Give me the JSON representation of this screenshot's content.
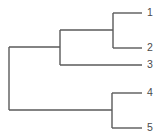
{
  "figure": {
    "width": 165,
    "height": 140,
    "background_color": "#ffffff",
    "line_color": "#5a5a5a",
    "label_color": "#4a4a4a"
  },
  "chart_data": {
    "type": "diagram",
    "diagram_type": "dendrogram",
    "orientation": "horizontal-right-facing",
    "title": "",
    "xlabel": "",
    "ylabel": "",
    "grid": false,
    "legend": null,
    "axis_visible": false,
    "leaves": [
      {
        "id": "leaf-1",
        "label": "1",
        "y": 13,
        "branch_x_start": 113,
        "branch_x_end": 142,
        "label_x": 147
      },
      {
        "id": "leaf-2",
        "label": "2",
        "y": 48,
        "branch_x_start": 113,
        "branch_x_end": 142,
        "label_x": 147
      },
      {
        "id": "leaf-3",
        "label": "3",
        "y": 65,
        "branch_x_start": 60,
        "branch_x_end": 142,
        "label_x": 147
      },
      {
        "id": "leaf-4",
        "label": "4",
        "y": 93,
        "branch_x_start": 112,
        "branch_x_end": 142,
        "label_x": 147
      },
      {
        "id": "leaf-5",
        "label": "5",
        "y": 128,
        "branch_x_start": 112,
        "branch_x_end": 142,
        "label_x": 147
      }
    ],
    "nodes": [
      {
        "id": "node-root",
        "name": "root-node",
        "x": 9,
        "y_top": 47,
        "y_bottom": 110,
        "children": [
          "node-a",
          "node-c"
        ],
        "child_branches": [
          {
            "to": "node-a",
            "y": 47,
            "x_from": 9,
            "x_to": 60
          },
          {
            "to": "node-c",
            "y": 110,
            "x_from": 9,
            "x_to": 112
          }
        ]
      },
      {
        "id": "node-a",
        "name": "cluster-123-node",
        "x": 60,
        "y_top": 30,
        "y_bottom": 65,
        "children": [
          "node-b",
          "leaf-3"
        ],
        "child_branches": [
          {
            "to": "node-b",
            "y": 30,
            "x_from": 60,
            "x_to": 113
          },
          {
            "to": "leaf-3",
            "y": 65,
            "x_from": 60,
            "x_to": 142
          }
        ]
      },
      {
        "id": "node-b",
        "name": "cluster-12-node",
        "x": 113,
        "y_top": 13,
        "y_bottom": 48,
        "children": [
          "leaf-1",
          "leaf-2"
        ],
        "child_branches": [
          {
            "to": "leaf-1",
            "y": 13,
            "x_from": 113,
            "x_to": 142
          },
          {
            "to": "leaf-2",
            "y": 48,
            "x_from": 113,
            "x_to": 142
          }
        ]
      },
      {
        "id": "node-c",
        "name": "cluster-45-node",
        "x": 112,
        "y_top": 93,
        "y_bottom": 128,
        "children": [
          "leaf-4",
          "leaf-5"
        ],
        "child_branches": [
          {
            "to": "leaf-4",
            "y": 93,
            "x_from": 112,
            "x_to": 142
          },
          {
            "to": "leaf-5",
            "y": 128,
            "x_from": 112,
            "x_to": 142
          }
        ]
      }
    ],
    "clusters": [
      {
        "name": "cluster-12",
        "members": [
          "1",
          "2"
        ]
      },
      {
        "name": "cluster-123",
        "members": [
          "1",
          "2",
          "3"
        ]
      },
      {
        "name": "cluster-45",
        "members": [
          "4",
          "5"
        ]
      },
      {
        "name": "cluster-all",
        "members": [
          "1",
          "2",
          "3",
          "4",
          "5"
        ]
      }
    ]
  }
}
